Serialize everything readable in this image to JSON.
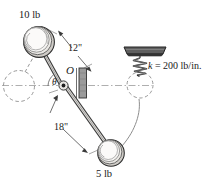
{
  "figure": {
    "type": "engineering-mechanics-diagram",
    "background_color": "#ffffff",
    "ink_color": "#2b2b2b",
    "labels": {
      "weight_top": "10 lb",
      "weight_bottom": "5 lb",
      "dimension_upper": "12\"",
      "dimension_lower": "18\"",
      "pivot": "O",
      "angle": "θ",
      "spring_stiffness_symbol": "k",
      "spring_stiffness_equals": " = ",
      "spring_stiffness_value": "200 lb/in.",
      "spring_stiffness_full": "k = 200 lb/in."
    },
    "geometry": {
      "pivot_x": 63,
      "pivot_y": 85,
      "top_sphere_center_x": 38,
      "top_sphere_center_y": 41,
      "top_sphere_radius": 15,
      "bottom_sphere_center_x": 110,
      "bottom_sphere_center_y": 152,
      "bottom_sphere_radius": 13,
      "ghost_left_center_x": 19,
      "ghost_left_center_y": 86,
      "ghost_left_radius": 15,
      "ghost_right_center_x": 140,
      "ghost_right_center_y": 85,
      "ghost_right_radius": 13,
      "support_plate_x": 126,
      "support_plate_y": 47,
      "support_plate_width": 40,
      "support_plate_height": 7,
      "spring_top_y": 54,
      "spring_bottom_y": 74,
      "spring_center_x": 140,
      "spring_coils": 6,
      "bracket_x": 79,
      "bracket_y": 68,
      "bracket_width": 8,
      "bracket_height": 30
    },
    "colors": {
      "sphere_fill": "#f4f3f1",
      "sphere_stroke": "#4a4a4a",
      "plate_fill": "#5d5d5d",
      "plate_stroke": "#2b2b2b",
      "bracket_fill": "#8c8c8c",
      "dashed_stroke": "#8a8a8a",
      "centerline_stroke": "#8a8a8a",
      "rod_fill": "#d9d7d3",
      "rod_stroke": "#4a4a4a"
    }
  }
}
